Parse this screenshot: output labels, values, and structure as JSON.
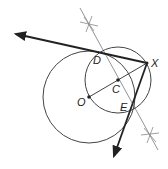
{
  "diagram": {
    "colors": {
      "stroke": "#222222",
      "light_stroke": "#777777",
      "background": "#ffffff"
    },
    "points": {
      "X": {
        "label": "X",
        "x": 147,
        "y": 63
      },
      "O": {
        "label": "O",
        "x": 89,
        "y": 97
      },
      "C": {
        "label": "C",
        "x": 118,
        "y": 80
      },
      "D": {
        "label": "D",
        "x": 96,
        "y": 52
      },
      "E": {
        "label": "E",
        "x": 130,
        "y": 107
      }
    },
    "circles": [
      {
        "name": "circle-O",
        "cx": 89,
        "cy": 97,
        "r": 46
      },
      {
        "name": "circle-C",
        "cx": 118,
        "cy": 80,
        "r": 33
      }
    ],
    "rays": [
      {
        "name": "tangent-XD",
        "from": "X",
        "to_x": 14,
        "to_y": 34
      },
      {
        "name": "tangent-XE",
        "from": "X",
        "to_x": 113,
        "to_y": 158
      }
    ],
    "bisector": {
      "x1": 80,
      "y1": 8,
      "x2": 158,
      "y2": 150
    },
    "arc_marks": [
      {
        "name": "top-arc-mark",
        "x": 89,
        "y": 24
      },
      {
        "name": "bottom-arc-mark",
        "x": 150,
        "y": 135
      }
    ]
  }
}
